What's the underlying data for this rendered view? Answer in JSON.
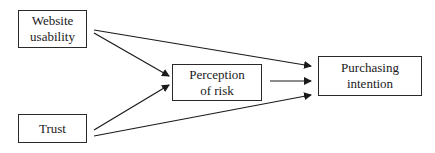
{
  "diagram": {
    "nodes": [
      {
        "id": "website_usability",
        "lines": [
          "Website",
          "usability"
        ]
      },
      {
        "id": "perception_of_risk",
        "lines": [
          "Perception",
          "of risk"
        ]
      },
      {
        "id": "purchasing_intention",
        "lines": [
          "Purchasing",
          "intention"
        ]
      },
      {
        "id": "trust",
        "lines": [
          "Trust"
        ]
      }
    ],
    "edges": [
      {
        "from": "website_usability",
        "to": "perception_of_risk"
      },
      {
        "from": "website_usability",
        "to": "purchasing_intention"
      },
      {
        "from": "trust",
        "to": "perception_of_risk"
      },
      {
        "from": "trust",
        "to": "purchasing_intention"
      },
      {
        "from": "perception_of_risk",
        "to": "purchasing_intention"
      }
    ],
    "line_color": "#1a1a1a"
  }
}
